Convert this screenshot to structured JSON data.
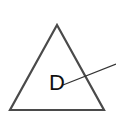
{
  "diagram": {
    "shape": "triangle",
    "label": "D",
    "colors": {
      "stroke": "#444444",
      "text": "#111111",
      "leader": "#333333",
      "background": "#ffffff"
    }
  }
}
